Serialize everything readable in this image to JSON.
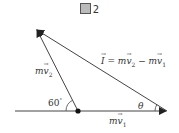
{
  "figure": {
    "title_number": "2",
    "title_icon": "kanji-zu-glyph",
    "labels": {
      "mv2": {
        "prefix": "m",
        "vec": "v",
        "sub": "2"
      },
      "mv1": {
        "prefix": "m",
        "vec": "v",
        "sub": "1"
      },
      "impulse_lhs": "I",
      "impulse_eq": " = ",
      "impulse_rhs_1": {
        "prefix": "m",
        "vec": "v",
        "sub": "2"
      },
      "impulse_minus": " − ",
      "impulse_rhs_2": {
        "prefix": "m",
        "vec": "v",
        "sub": "1"
      },
      "angle_60": "60",
      "angle_degree": "°",
      "angle_theta": "θ"
    },
    "colors": {
      "line": "#333333",
      "text": "#333333",
      "background": "#ffffff"
    },
    "geometry": {
      "baseline": {
        "x1": 15,
        "y1": 111,
        "x2": 167,
        "y2": 111
      },
      "origin_dot": {
        "x": 78,
        "y": 111
      },
      "tip_mv2": {
        "x": 36,
        "y": 29
      },
      "tip_mv1": {
        "x": 167,
        "y": 111
      }
    }
  }
}
